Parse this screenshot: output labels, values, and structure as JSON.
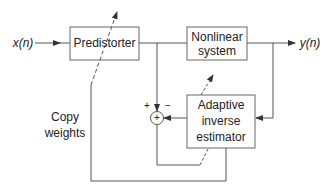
{
  "diagram": {
    "input_label": "x(n)",
    "output_label": "y(n)",
    "blocks": {
      "predistorter": "Predistorter",
      "nonlinear_line1": "Nonlinear",
      "nonlinear_line2": "system",
      "adaptive_line1": "Adaptive",
      "adaptive_line2": "inverse",
      "adaptive_line3": "estimator"
    },
    "copy_weights_line1": "Copy",
    "copy_weights_line2": "weights",
    "summing_junction": {
      "symbol": "+",
      "plus_sign": "+",
      "minus_sign": "−"
    },
    "colors": {
      "line": "#555555",
      "text": "#222222"
    }
  }
}
